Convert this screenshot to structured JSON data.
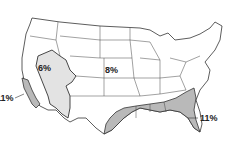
{
  "map": {
    "type": "choropleth",
    "subject": "United States regions",
    "colors": {
      "background": "#ffffff",
      "border": "#333333",
      "light_region": "#e3e3e3",
      "dark_region": "#b9b9b9"
    },
    "labels": {
      "west_coast": "11%",
      "great_basin": "6%",
      "central": "8%",
      "southeast": "11%"
    },
    "regions": [
      {
        "name": "West Coast (California)",
        "value": "11%",
        "shade": "dark"
      },
      {
        "name": "Great Basin / Southwest",
        "value": "6%",
        "shade": "light"
      },
      {
        "name": "Central / Rest of US",
        "value": "8%",
        "shade": "none"
      },
      {
        "name": "Southeast Gulf Coast",
        "value": "11%",
        "shade": "dark"
      }
    ]
  }
}
